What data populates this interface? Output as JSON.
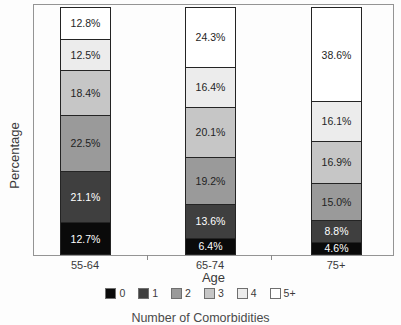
{
  "chart_data": {
    "type": "bar",
    "stacked": true,
    "title": "",
    "xlabel": "Age",
    "ylabel": "Percentage",
    "footer_caption": "Number of Comorbidities",
    "categories": [
      "55-64",
      "65-74",
      "75+"
    ],
    "series": [
      {
        "name": "0",
        "color": "#0a0a0a",
        "label_color": "#ffffff",
        "values": [
          12.7,
          6.4,
          4.6
        ]
      },
      {
        "name": "1",
        "color": "#3f3f3f",
        "label_color": "#ffffff",
        "values": [
          21.1,
          13.6,
          8.8
        ]
      },
      {
        "name": "2",
        "color": "#9a9a9a",
        "label_color": "#1f1f1f",
        "values": [
          22.5,
          19.2,
          15.0
        ]
      },
      {
        "name": "3",
        "color": "#c6c6c6",
        "label_color": "#1f1f1f",
        "values": [
          18.4,
          20.1,
          16.9
        ]
      },
      {
        "name": "4",
        "color": "#ececec",
        "label_color": "#1f1f1f",
        "values": [
          12.5,
          16.4,
          16.1
        ]
      },
      {
        "name": "5+",
        "color": "#ffffff",
        "label_color": "#1f1f1f",
        "values": [
          12.8,
          24.3,
          38.6
        ]
      }
    ],
    "ylim": [
      0,
      100
    ],
    "value_suffix": "%",
    "legend_position": "bottom",
    "grid": false
  }
}
